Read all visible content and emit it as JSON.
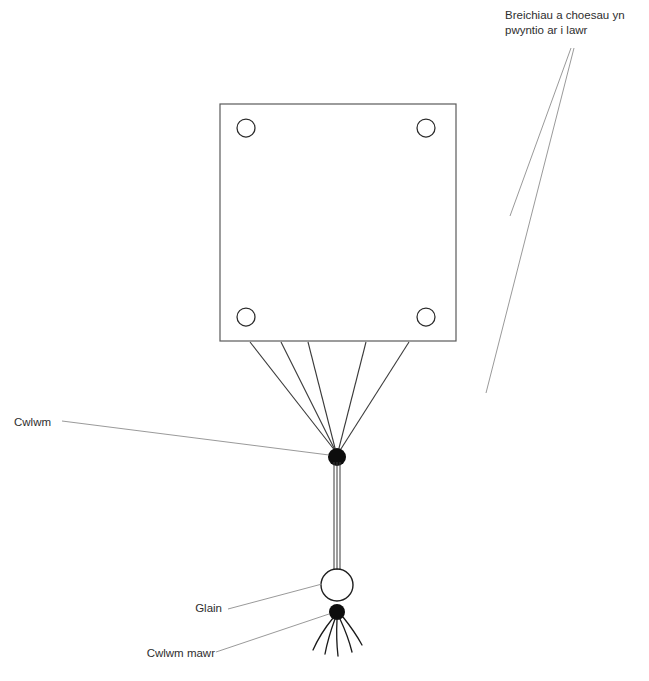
{
  "diagram": {
    "background_color": "#ffffff",
    "line_color": "#4a4a4a",
    "knot_color": "#0d0d0d",
    "leader_color": "#8d8d8d"
  },
  "labels": {
    "limbs": "Breichiau a choesau yn\npwyntio ar i lawr",
    "knot": "Cwlwm",
    "bead": "Glain",
    "big_knot": "Cwlwm mawr"
  },
  "shapes": {
    "body": {
      "name": "body-square",
      "x": 220,
      "y": 104,
      "width": 236,
      "height": 237
    },
    "joint_circles": [
      {
        "name": "joint-top-left",
        "cx": 246,
        "cy": 128,
        "r": 9
      },
      {
        "name": "joint-top-right",
        "cx": 426,
        "cy": 128,
        "r": 9
      },
      {
        "name": "joint-bottom-left",
        "cx": 246,
        "cy": 317,
        "r": 9
      },
      {
        "name": "joint-bottom-right",
        "cx": 426,
        "cy": 317,
        "r": 9
      }
    ],
    "limbs": [
      {
        "name": "arm-upper-left",
        "x1": 221,
        "y1": 143,
        "x2": 80,
        "y2": 320,
        "half_width": 16
      },
      {
        "name": "arm-upper-right",
        "x1": 455,
        "y1": 143,
        "x2": 606,
        "y2": 310,
        "half_width": 16
      },
      {
        "name": "leg-lower-left",
        "x1": 238,
        "y1": 342,
        "x2": 92,
        "y2": 527,
        "half_width": 16
      },
      {
        "name": "leg-lower-right",
        "x1": 438,
        "y1": 342,
        "x2": 578,
        "y2": 523,
        "half_width": 16
      }
    ],
    "knot": {
      "name": "knot",
      "cx": 337,
      "cy": 457,
      "r": 9
    },
    "threads_from_body": [
      {
        "x1": 250,
        "y1": 342,
        "x2": 336,
        "y2": 452
      },
      {
        "x1": 281,
        "y1": 342,
        "x2": 336,
        "y2": 452
      },
      {
        "x1": 308,
        "y1": 342,
        "x2": 336,
        "y2": 452
      },
      {
        "x1": 366,
        "y1": 342,
        "x2": 338,
        "y2": 452
      },
      {
        "x1": 409,
        "y1": 342,
        "x2": 339,
        "y2": 452
      }
    ],
    "cord": {
      "name": "cord",
      "x": 337,
      "y_top": 462,
      "y_bottom": 568,
      "strands": 3
    },
    "bead": {
      "name": "bead",
      "cx": 337,
      "cy": 585,
      "r": 16
    },
    "big_knot": {
      "name": "big-knot",
      "cx": 337,
      "cy": 612,
      "r": 8
    },
    "tassel": [
      {
        "x1": 333,
        "y1": 618,
        "x2": 313,
        "y2": 650
      },
      {
        "x1": 335,
        "y1": 619,
        "x2": 325,
        "y2": 654
      },
      {
        "x1": 337,
        "y1": 620,
        "x2": 338,
        "y2": 656
      },
      {
        "x1": 340,
        "y1": 619,
        "x2": 352,
        "y2": 652
      },
      {
        "x1": 343,
        "y1": 617,
        "x2": 362,
        "y2": 645
      }
    ],
    "leaders": [
      {
        "name": "leader-limbs-upper",
        "x1": 571,
        "y1": 48,
        "x2": 510,
        "y2": 216
      },
      {
        "name": "leader-limbs-lower",
        "x1": 574,
        "y1": 48,
        "x2": 486,
        "y2": 393
      },
      {
        "name": "leader-knot",
        "x1": 62,
        "y1": 421,
        "x2": 329,
        "y2": 455
      },
      {
        "name": "leader-bead",
        "x1": 228,
        "y1": 609,
        "x2": 322,
        "y2": 584
      },
      {
        "name": "leader-big-knot",
        "x1": 216,
        "y1": 652,
        "x2": 329,
        "y2": 614
      }
    ]
  }
}
